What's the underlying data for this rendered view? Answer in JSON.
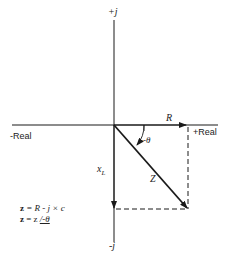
{
  "diagram": {
    "axes": {
      "positive_imag": "+j",
      "negative_imag": "-j",
      "negative_real": "-Real",
      "positive_real": "+Real"
    },
    "vectors": {
      "resistance": "R",
      "reactance": "x",
      "reactance_sub": "L",
      "impedance": "Z",
      "angle": "-θ"
    },
    "equations": {
      "line1_lhs": "z",
      "line1_rhs": " = R - j × c",
      "line2_lhs": "z",
      "line2_mid": " = z ",
      "line2_angle": "/-θ"
    },
    "colors": {
      "line": "#1a1a1a",
      "background": "#ffffff"
    }
  }
}
